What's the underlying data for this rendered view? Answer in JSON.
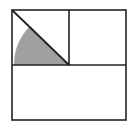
{
  "diagram": {
    "type": "geometry",
    "colors": {
      "background": "#ffffff",
      "stroke": "#222222",
      "shade": "#a0a0a0"
    },
    "outer_square": {
      "x": 12,
      "y": 10,
      "width": 114,
      "height": 110
    },
    "vertical_divider": {
      "x": 69,
      "y1": 10,
      "y2": 65
    },
    "horizontal_divider": {
      "y": 65,
      "x1": 12,
      "x2": 126
    },
    "diagonal": {
      "x1": 12,
      "y1": 10,
      "x2": 69,
      "y2": 65
    },
    "shaded_sector": {
      "center_x": 69,
      "center_y": 65,
      "radius": 55,
      "from_angle_deg": 180,
      "to_angle_deg": 225
    }
  }
}
